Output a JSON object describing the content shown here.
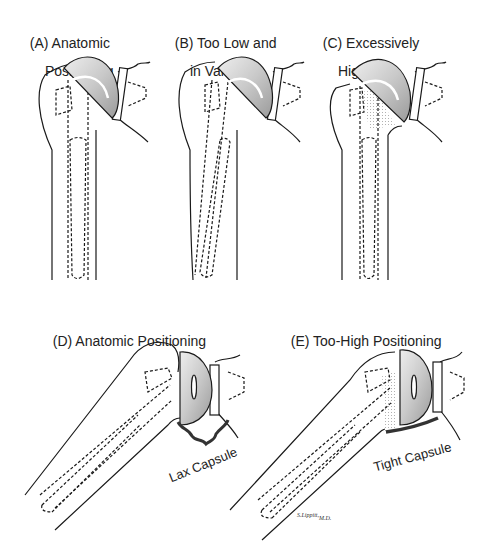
{
  "figure": {
    "panels": [
      {
        "id": "A",
        "label_line1": "(A) Anatomic",
        "label_line2": "Positioning"
      },
      {
        "id": "B",
        "label_line1": "(B) Too Low and",
        "label_line2": "in Varus"
      },
      {
        "id": "C",
        "label_line1": "(C) Excessively",
        "label_line2": "High"
      },
      {
        "id": "D",
        "label_line1": "(D) Anatomic Positioning",
        "annotation": "Lax Capsule"
      },
      {
        "id": "E",
        "label_line1": "(E) Too-High Positioning",
        "annotation": "Tight Capsule"
      }
    ],
    "signature": {
      "name": "S.Lippitt,",
      "suffix": "M.D."
    },
    "colors": {
      "line": "#1a1a1a",
      "implant_fill": "#c8c8c8",
      "implant_highlight": "#f2f2f2",
      "capsule": "#333333",
      "background": "#ffffff"
    }
  }
}
